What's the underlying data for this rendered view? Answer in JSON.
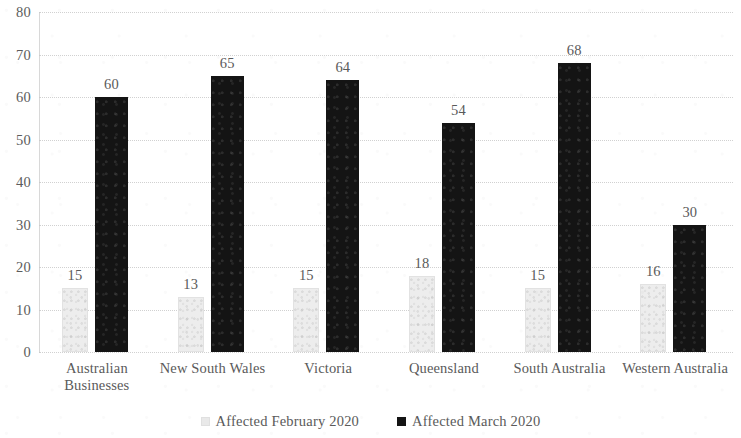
{
  "chart_data": {
    "type": "bar",
    "title": "",
    "subtitle": "",
    "xlabel": "",
    "ylabel": "",
    "ylim": [
      0,
      80
    ],
    "ytick_step": 10,
    "yticks": [
      "0",
      "10",
      "20",
      "30",
      "40",
      "50",
      "60",
      "70",
      "80"
    ],
    "grid": true,
    "grid_style": "dotted-horizontal",
    "legend_position": "bottom-center",
    "categories": [
      "Australian Businesses",
      "New South Wales",
      "Victoria",
      "Queensland",
      "South Australia",
      "Western Australia"
    ],
    "category_lines": [
      [
        "Australian",
        "Businesses"
      ],
      [
        "New South Wales"
      ],
      [
        "Victoria"
      ],
      [
        "Queensland"
      ],
      [
        "South Australia"
      ],
      [
        "Western Australia"
      ]
    ],
    "series": [
      {
        "name": "Affected February 2020",
        "color": "#ededed",
        "values": [
          15,
          13,
          15,
          18,
          15,
          16
        ],
        "labels": [
          "15",
          "13",
          "15",
          "18",
          "15",
          "16"
        ]
      },
      {
        "name": "Affected March 2020",
        "color": "#141414",
        "values": [
          60,
          65,
          64,
          54,
          68,
          30
        ],
        "labels": [
          "60",
          "65",
          "64",
          "54",
          "68",
          "30"
        ]
      }
    ]
  },
  "legend": {
    "items": [
      {
        "label": "Affected February 2020",
        "swatch": "feb"
      },
      {
        "label": "Affected March 2020",
        "swatch": "mar"
      }
    ]
  },
  "colors": {
    "series_february": "#ededed",
    "series_march": "#141414",
    "gridline": "#c9c9c9",
    "text": "#5a5a5a",
    "background": "#ffffff"
  }
}
